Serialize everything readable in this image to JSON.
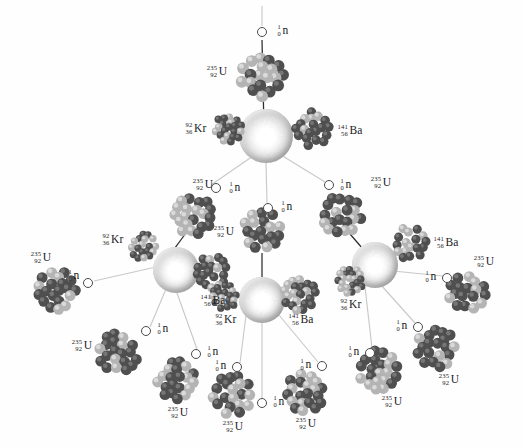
{
  "figure": {
    "background_color": "#ffffff",
    "width": 522,
    "height": 448
  },
  "species": {
    "uranium": {
      "mass": "235",
      "atomic": "92",
      "symbol": "U",
      "name": "uranium-235"
    },
    "krypton": {
      "mass": "92",
      "atomic": "36",
      "symbol": "Kr",
      "name": "krypton-92"
    },
    "barium": {
      "mass": "141",
      "atomic": "56",
      "symbol": "Ba",
      "name": "barium-141"
    },
    "neutron": {
      "mass": "1",
      "atomic": "0",
      "symbol": "n",
      "name": "neutron"
    }
  },
  "colors": {
    "nucleus_dark": "#4f4f4f",
    "nucleus_light": "#b4b4b4",
    "flash_center": "#ffffff",
    "flash_edge": "#9c9c9c",
    "arrow": "#2a2a2a",
    "ray": "#c9c9c9",
    "text": "#1a1a1a"
  },
  "nuclei": [
    {
      "id": "u-gen0",
      "species": "uranium",
      "x": 262,
      "y": 76,
      "r": 26,
      "seed": 11
    },
    {
      "id": "kr-f1",
      "species": "krypton",
      "x": 228,
      "y": 129,
      "r": 17,
      "seed": 21
    },
    {
      "id": "ba-f1",
      "species": "barium",
      "x": 313,
      "y": 129,
      "r": 21,
      "seed": 22
    },
    {
      "id": "u-gen1-l",
      "species": "uranium",
      "x": 193,
      "y": 215,
      "r": 24,
      "seed": 31
    },
    {
      "id": "u-gen1-c",
      "species": "uranium",
      "x": 262,
      "y": 231,
      "r": 24,
      "seed": 32
    },
    {
      "id": "u-gen1-r",
      "species": "uranium",
      "x": 342,
      "y": 215,
      "r": 24,
      "seed": 33
    },
    {
      "id": "kr-f2l",
      "species": "krypton",
      "x": 144,
      "y": 247,
      "r": 16,
      "seed": 41
    },
    {
      "id": "ba-f2l",
      "species": "barium",
      "x": 212,
      "y": 272,
      "r": 20,
      "seed": 42
    },
    {
      "id": "kr-f2c",
      "species": "krypton",
      "x": 224,
      "y": 297,
      "r": 16,
      "seed": 43
    },
    {
      "id": "ba-f2c",
      "species": "barium",
      "x": 300,
      "y": 295,
      "r": 20,
      "seed": 44
    },
    {
      "id": "ba-f2r",
      "species": "barium",
      "x": 410,
      "y": 243,
      "r": 20,
      "seed": 45
    },
    {
      "id": "kr-f2r",
      "species": "krypton",
      "x": 350,
      "y": 281,
      "r": 16,
      "seed": 46
    },
    {
      "id": "u-gen2-a",
      "species": "uranium",
      "x": 57,
      "y": 290,
      "r": 24,
      "seed": 51
    },
    {
      "id": "u-gen2-b",
      "species": "uranium",
      "x": 118,
      "y": 353,
      "r": 24,
      "seed": 52
    },
    {
      "id": "u-gen2-c",
      "species": "uranium",
      "x": 177,
      "y": 381,
      "r": 24,
      "seed": 53
    },
    {
      "id": "u-gen2-d",
      "species": "uranium",
      "x": 232,
      "y": 395,
      "r": 24,
      "seed": 54
    },
    {
      "id": "u-gen2-e",
      "species": "uranium",
      "x": 305,
      "y": 392,
      "r": 24,
      "seed": 55
    },
    {
      "id": "u-gen2-f",
      "species": "uranium",
      "x": 378,
      "y": 370,
      "r": 24,
      "seed": 56
    },
    {
      "id": "u-gen2-g",
      "species": "uranium",
      "x": 436,
      "y": 348,
      "r": 24,
      "seed": 57
    },
    {
      "id": "u-gen2-h",
      "species": "uranium",
      "x": 468,
      "y": 293,
      "r": 24,
      "seed": 58
    }
  ],
  "flashes": [
    {
      "id": "flash-gen1",
      "x": 266,
      "y": 136,
      "r": 27
    },
    {
      "id": "flash-gen2-l",
      "x": 176,
      "y": 270,
      "r": 23
    },
    {
      "id": "flash-gen2-c",
      "x": 262,
      "y": 300,
      "r": 23
    },
    {
      "id": "flash-gen2-r",
      "x": 375,
      "y": 265,
      "r": 23
    }
  ],
  "neutrons": [
    {
      "id": "n-incident",
      "x": 262,
      "y": 32,
      "label_side": "right"
    },
    {
      "id": "n-gen1-l",
      "x": 216,
      "y": 188,
      "label_side": "right"
    },
    {
      "id": "n-gen1-c",
      "x": 268,
      "y": 208,
      "label_side": "right"
    },
    {
      "id": "n-gen1-r",
      "x": 329,
      "y": 185,
      "label_side": "right"
    },
    {
      "id": "n-gen2-a",
      "x": 88,
      "y": 283,
      "label_side": "left"
    },
    {
      "id": "n-gen2-b",
      "x": 146,
      "y": 331,
      "label_side": "right"
    },
    {
      "id": "n-gen2-c",
      "x": 196,
      "y": 354,
      "label_side": "right"
    },
    {
      "id": "n-gen2-d",
      "x": 237,
      "y": 367,
      "label_side": "left"
    },
    {
      "id": "n-gen2-free",
      "x": 262,
      "y": 403,
      "label_side": "right"
    },
    {
      "id": "n-gen2-e",
      "x": 322,
      "y": 366,
      "label_side": "left"
    },
    {
      "id": "n-gen2-f",
      "x": 370,
      "y": 353,
      "label_side": "left"
    },
    {
      "id": "n-gen2-g",
      "x": 418,
      "y": 327,
      "label_side": "left"
    },
    {
      "id": "n-gen2-h",
      "x": 447,
      "y": 278,
      "label_side": "left"
    }
  ],
  "labels": [
    {
      "id": "lbl-u-gen0",
      "species": "uranium",
      "x": 217,
      "y": 72
    },
    {
      "id": "lbl-n-incid",
      "species": "neutron",
      "x": 283,
      "y": 31
    },
    {
      "id": "lbl-kr-f1",
      "species": "krypton",
      "x": 196,
      "y": 129
    },
    {
      "id": "lbl-ba-f1",
      "species": "barium",
      "x": 350,
      "y": 131
    },
    {
      "id": "lbl-u-gen1-l",
      "species": "uranium",
      "x": 203,
      "y": 185
    },
    {
      "id": "lbl-n-gen1-l",
      "species": "neutron",
      "x": 235,
      "y": 188
    },
    {
      "id": "lbl-u-gen1-c",
      "species": "uranium",
      "x": 224,
      "y": 232
    },
    {
      "id": "lbl-n-gen1-c",
      "species": "neutron",
      "x": 287,
      "y": 207
    },
    {
      "id": "lbl-u-gen1-r",
      "species": "uranium",
      "x": 381,
      "y": 183
    },
    {
      "id": "lbl-n-gen1-r",
      "species": "neutron",
      "x": 346,
      "y": 185
    },
    {
      "id": "lbl-kr-f2l",
      "species": "krypton",
      "x": 113,
      "y": 240
    },
    {
      "id": "lbl-ba-f2l",
      "species": "barium",
      "x": 213,
      "y": 301
    },
    {
      "id": "lbl-kr-f2c",
      "species": "krypton",
      "x": 226,
      "y": 320
    },
    {
      "id": "lbl-ba-f2c",
      "species": "barium",
      "x": 301,
      "y": 320
    },
    {
      "id": "lbl-ba-f2r",
      "species": "barium",
      "x": 446,
      "y": 243
    },
    {
      "id": "lbl-kr-f2r",
      "species": "krypton",
      "x": 351,
      "y": 305
    },
    {
      "id": "lbl-u-gen2-a",
      "species": "uranium",
      "x": 41,
      "y": 258
    },
    {
      "id": "lbl-n-gen2-a",
      "species": "neutron",
      "x": 74,
      "y": 276
    },
    {
      "id": "lbl-u-gen2-b",
      "species": "uranium",
      "x": 82,
      "y": 346
    },
    {
      "id": "lbl-n-gen2-b",
      "species": "neutron",
      "x": 163,
      "y": 329
    },
    {
      "id": "lbl-u-gen2-c",
      "species": "uranium",
      "x": 178,
      "y": 413
    },
    {
      "id": "lbl-n-gen2-c",
      "species": "neutron",
      "x": 213,
      "y": 352
    },
    {
      "id": "lbl-u-gen2-d",
      "species": "uranium",
      "x": 233,
      "y": 427
    },
    {
      "id": "lbl-n-gen2-d",
      "species": "neutron",
      "x": 221,
      "y": 366
    },
    {
      "id": "lbl-n-free",
      "species": "neutron",
      "x": 279,
      "y": 402
    },
    {
      "id": "lbl-u-gen2-e",
      "species": "uranium",
      "x": 306,
      "y": 424
    },
    {
      "id": "lbl-n-gen2-e",
      "species": "neutron",
      "x": 306,
      "y": 365
    },
    {
      "id": "lbl-u-gen2-f",
      "species": "uranium",
      "x": 392,
      "y": 402
    },
    {
      "id": "lbl-n-gen2-f",
      "species": "neutron",
      "x": 354,
      "y": 352
    },
    {
      "id": "lbl-u-gen2-g",
      "species": "uranium",
      "x": 449,
      "y": 380
    },
    {
      "id": "lbl-n-gen2-g",
      "species": "neutron",
      "x": 402,
      "y": 326
    },
    {
      "id": "lbl-u-gen2-h",
      "species": "uranium",
      "x": 484,
      "y": 262
    },
    {
      "id": "lbl-n-gen2-h",
      "species": "neutron",
      "x": 431,
      "y": 277
    }
  ],
  "arrows": [
    {
      "id": "arrow-incident",
      "x1": 262,
      "y1": 40,
      "x2": 264,
      "y2": 128
    },
    {
      "id": "arrow-gen1-l",
      "x1": 186,
      "y1": 233,
      "x2": 166,
      "y2": 260
    },
    {
      "id": "arrow-gen1-c",
      "x1": 262,
      "y1": 253,
      "x2": 262,
      "y2": 291
    },
    {
      "id": "arrow-gen1-r",
      "x1": 350,
      "y1": 234,
      "x2": 369,
      "y2": 256
    }
  ],
  "rays": [
    {
      "id": "ray-top-in",
      "x1": 262,
      "y1": 6,
      "x2": 262,
      "y2": 26
    },
    {
      "id": "ray-g1-l",
      "x1": 253,
      "y1": 156,
      "x2": 211,
      "y2": 185
    },
    {
      "id": "ray-g1-c",
      "x1": 266,
      "y1": 163,
      "x2": 267,
      "y2": 203
    },
    {
      "id": "ray-g1-r",
      "x1": 281,
      "y1": 155,
      "x2": 325,
      "y2": 182
    },
    {
      "id": "ray-g2l-a",
      "x1": 156,
      "y1": 267,
      "x2": 94,
      "y2": 281
    },
    {
      "id": "ray-g2l-b",
      "x1": 166,
      "y1": 289,
      "x2": 150,
      "y2": 327
    },
    {
      "id": "ray-g2l-c",
      "x1": 177,
      "y1": 293,
      "x2": 197,
      "y2": 349
    },
    {
      "id": "ray-g2c-a",
      "x1": 246,
      "y1": 315,
      "x2": 240,
      "y2": 363
    },
    {
      "id": "ray-g2c-b",
      "x1": 262,
      "y1": 323,
      "x2": 262,
      "y2": 398
    },
    {
      "id": "ray-g2c-c",
      "x1": 279,
      "y1": 315,
      "x2": 318,
      "y2": 362
    },
    {
      "id": "ray-g2r-a",
      "x1": 365,
      "y1": 287,
      "x2": 372,
      "y2": 348
    },
    {
      "id": "ray-g2r-b",
      "x1": 381,
      "y1": 285,
      "x2": 415,
      "y2": 323
    },
    {
      "id": "ray-g2r-c",
      "x1": 393,
      "y1": 271,
      "x2": 443,
      "y2": 276
    }
  ]
}
